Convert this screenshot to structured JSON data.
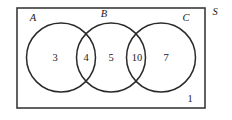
{
  "figure": {
    "type": "venn-diagram",
    "universe": {
      "label": "S",
      "outside_count": "1",
      "rect": {
        "x": 17,
        "y": 8,
        "width": 188,
        "height": 100
      },
      "stroke_color": "#3a3a3a",
      "fill_color": "#ffffff"
    },
    "circles": [
      {
        "label": "A",
        "cx": 61,
        "cy": 57.5,
        "r": 34.5,
        "label_x": 33,
        "label_y": 21
      },
      {
        "label": "B",
        "cx": 111,
        "cy": 57.5,
        "r": 34.5,
        "label_x": 104,
        "label_y": 16
      },
      {
        "label": "C",
        "cx": 161,
        "cy": 57.5,
        "r": 34.5,
        "label_x": 186,
        "label_y": 21
      }
    ],
    "regions": [
      {
        "name": "A-only",
        "count": "3",
        "x": 55,
        "y": 61
      },
      {
        "name": "A-and-B",
        "count": "4",
        "x": 86,
        "y": 61
      },
      {
        "name": "B-only",
        "count": "5",
        "x": 111,
        "y": 61
      },
      {
        "name": "B-and-C",
        "count": "10",
        "x": 137,
        "y": 61
      },
      {
        "name": "C-only",
        "count": "7",
        "x": 166,
        "y": 61
      },
      {
        "name": "outside-all",
        "count": "1",
        "x": 190,
        "y": 101
      }
    ],
    "colors": {
      "stroke": "#2a2a2a",
      "rect_stroke": "#3a3a3a",
      "background": "#ffffff",
      "text": "#1a1a1a"
    }
  }
}
